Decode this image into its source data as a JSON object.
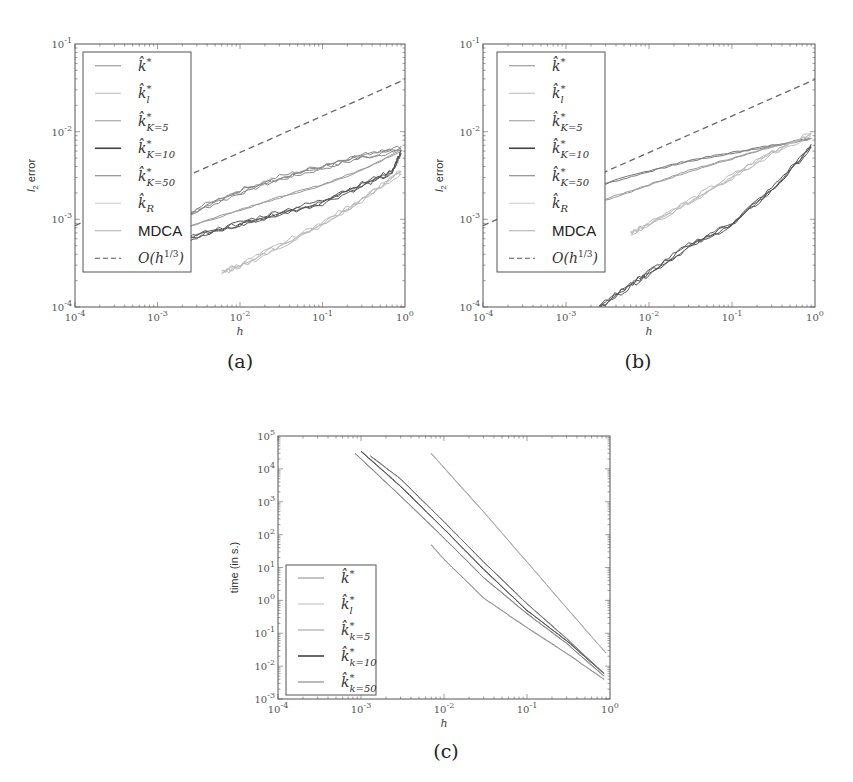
{
  "figure": {
    "captions": [
      "(a)",
      "(b)",
      "(c)"
    ]
  },
  "chart_data": [
    {
      "id": "a",
      "type": "line",
      "caption": "(a)",
      "xlabel": "h",
      "ylabel": "l2 error",
      "xscale": "log",
      "yscale": "log",
      "xlim": [
        0.0001,
        1
      ],
      "ylim": [
        0.0001,
        0.1
      ],
      "xticks": [
        "10^-4",
        "10^-3",
        "10^-2",
        "10^-1",
        "10^0"
      ],
      "yticks": [
        "10^-4",
        "10^-3",
        "10^-2",
        "10^-1"
      ],
      "legend_position": "upper left",
      "legend": [
        "k̂*",
        "k̂*_l",
        "k̂*_{K=5}",
        "k̂*_{K=10}",
        "k̂*_{K=50}",
        "k̂_R",
        "MDCA",
        "O(h^{1/3})"
      ],
      "series": [
        {
          "name": "k̂* (upper band)",
          "x": [
            0.001,
            0.003,
            0.01,
            0.03,
            0.1,
            0.3,
            0.9
          ],
          "y": [
            0.00075,
            0.0013,
            0.0021,
            0.003,
            0.004,
            0.0053,
            0.0065
          ],
          "color": "#888888"
        },
        {
          "name": "k̂*_{K=5}",
          "x": [
            0.001,
            0.003,
            0.01,
            0.03,
            0.1,
            0.3,
            0.9
          ],
          "y": [
            0.0006,
            0.0009,
            0.0013,
            0.0018,
            0.0025,
            0.0037,
            0.0062
          ],
          "color": "#999999"
        },
        {
          "name": "k̂*_{K=10} / k̂*_{K=50} (dark band)",
          "x": [
            0.001,
            0.003,
            0.01,
            0.03,
            0.1,
            0.3,
            0.7,
            0.9
          ],
          "y": [
            0.0005,
            0.00065,
            0.0009,
            0.0012,
            0.0016,
            0.0025,
            0.0035,
            0.006
          ],
          "color": "#555555"
        },
        {
          "name": "k̂_R / MDCA (light band)",
          "x": [
            0.006,
            0.01,
            0.03,
            0.1,
            0.3,
            0.9
          ],
          "y": [
            0.00025,
            0.0003,
            0.0005,
            0.0009,
            0.0017,
            0.0035
          ],
          "color": "#bbbbbb"
        },
        {
          "name": "O(h^{1/3})",
          "x": [
            0.0001,
            1
          ],
          "y": [
            0.00086,
            0.04
          ],
          "style": "dashed",
          "color": "#666666"
        }
      ]
    },
    {
      "id": "b",
      "type": "line",
      "caption": "(b)",
      "xlabel": "h",
      "ylabel": "l2 error",
      "xscale": "log",
      "yscale": "log",
      "xlim": [
        0.0001,
        1
      ],
      "ylim": [
        0.0001,
        0.1
      ],
      "xticks": [
        "10^-4",
        "10^-3",
        "10^-2",
        "10^-1",
        "10^0"
      ],
      "yticks": [
        "10^-4",
        "10^-3",
        "10^-2",
        "10^-1"
      ],
      "legend_position": "upper left",
      "legend": [
        "k̂*",
        "k̂*_l",
        "k̂*_{K=5}",
        "k̂*_{K=10}",
        "k̂*_{K=50}",
        "k̂_R",
        "MDCA",
        "O(h^{1/3})"
      ],
      "series": [
        {
          "name": "k̂* (upper curve)",
          "x": [
            0.001,
            0.003,
            0.01,
            0.03,
            0.1,
            0.3,
            0.9
          ],
          "y": [
            0.0017,
            0.0026,
            0.0036,
            0.0047,
            0.0058,
            0.007,
            0.0085
          ],
          "color": "#777777"
        },
        {
          "name": "k̂*_{K=5}",
          "x": [
            0.001,
            0.003,
            0.01,
            0.03,
            0.1,
            0.3,
            0.9
          ],
          "y": [
            0.0011,
            0.0017,
            0.0025,
            0.0036,
            0.005,
            0.0068,
            0.0085
          ],
          "color": "#999999"
        },
        {
          "name": "k̂_R / MDCA (light band)",
          "x": [
            0.006,
            0.01,
            0.03,
            0.1,
            0.3,
            0.9
          ],
          "y": [
            0.0007,
            0.0009,
            0.0016,
            0.0031,
            0.0058,
            0.0095
          ],
          "color": "#bbbbbb"
        },
        {
          "name": "k̂*_{K=10} / k̂*_{K=50} (dark band)",
          "x": [
            0.0025,
            0.006,
            0.01,
            0.03,
            0.1,
            0.3,
            0.9
          ],
          "y": [
            0.0001,
            0.00018,
            0.00025,
            0.0005,
            0.0009,
            0.0022,
            0.0068
          ],
          "color": "#555555"
        },
        {
          "name": "O(h^{1/3})",
          "x": [
            0.0001,
            1
          ],
          "y": [
            0.00086,
            0.04
          ],
          "style": "dashed",
          "color": "#666666"
        }
      ]
    },
    {
      "id": "c",
      "type": "line",
      "caption": "(c)",
      "xlabel": "h",
      "ylabel": "time (in s.)",
      "xscale": "log",
      "yscale": "log",
      "xlim": [
        0.0001,
        1
      ],
      "ylim": [
        0.001,
        100000
      ],
      "xticks": [
        "10^-4",
        "10^-3",
        "10^-2",
        "10^-1",
        "10^0"
      ],
      "yticks": [
        "10^-3",
        "10^-2",
        "10^-1",
        "10^0",
        "10^1",
        "10^2",
        "10^3",
        "10^4",
        "10^5"
      ],
      "legend_position": "lower left",
      "legend": [
        "k̂*",
        "k̂*_l",
        "k̂*_{k=5}",
        "k̂*_{k=10}",
        "k̂*_{k=50}"
      ],
      "series": [
        {
          "name": "k̂*",
          "x": [
            0.00085,
            0.003,
            0.01,
            0.03,
            0.1,
            0.3,
            0.85
          ],
          "y": [
            30000,
            1500,
            80,
            5,
            0.4,
            0.05,
            0.005
          ],
          "color": "#888888"
        },
        {
          "name": "k̂*_{k=10}",
          "x": [
            0.001,
            0.003,
            0.01,
            0.03,
            0.1,
            0.3,
            0.85
          ],
          "y": [
            35000,
            3000,
            150,
            9,
            0.5,
            0.06,
            0.006
          ],
          "color": "#555555"
        },
        {
          "name": "k̂*_{k=50}",
          "x": [
            0.0013,
            0.003,
            0.01,
            0.03,
            0.1,
            0.3,
            0.85
          ],
          "y": [
            25000,
            5000,
            250,
            15,
            0.8,
            0.07,
            0.006
          ],
          "color": "#777777"
        },
        {
          "name": "k̂*_{k=5}",
          "x": [
            0.007,
            0.01,
            0.03,
            0.1,
            0.3,
            0.85
          ],
          "y": [
            50,
            18,
            1.2,
            0.15,
            0.025,
            0.004
          ],
          "color": "#999999"
        },
        {
          "name": "k̂*_l",
          "x": [
            0.007,
            0.03,
            0.1,
            0.3,
            0.6,
            0.9
          ],
          "y": [
            30000,
            500,
            15,
            0.6,
            0.08,
            0.025
          ],
          "color": "#aaaaaa"
        }
      ]
    }
  ]
}
